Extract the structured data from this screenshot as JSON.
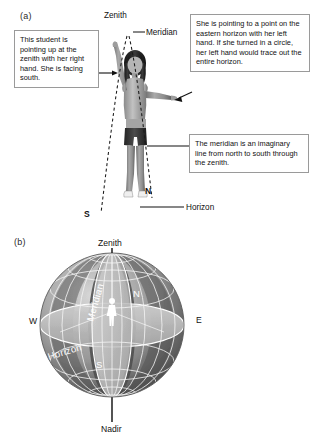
{
  "figure": {
    "panel_a": {
      "label": "(a)",
      "labels": {
        "zenith": "Zenith",
        "meridian": "Meridian",
        "horizon": "Horizon",
        "north": "N",
        "south": "S"
      },
      "callouts": {
        "left": "This student is pointing up at the zenith with her right hand. She is facing south.",
        "right_top": "She is pointing to a point on the eastern horizon with her left hand. If she turned in a circle, her left hand would trace out the entire horizon.",
        "right_bottom": "The meridian is an imaginary line from north to south through the zenith."
      }
    },
    "panel_b": {
      "label": "(b)",
      "labels": {
        "zenith": "Zenith",
        "nadir": "Nadir",
        "west": "W",
        "east": "E",
        "north": "N",
        "south": "S",
        "meridian": "Meridian",
        "horizon": "Horizon"
      }
    }
  },
  "colors": {
    "background": "#ffffff",
    "text": "#111111",
    "callout_border": "#9a9a9a",
    "dashed_line": "#1a1a1a",
    "sphere_dark": "#4a4a4a",
    "sphere_light": "#c9c9c9",
    "grid_line": "#f2f2f2",
    "white_label": "#ffffff"
  }
}
